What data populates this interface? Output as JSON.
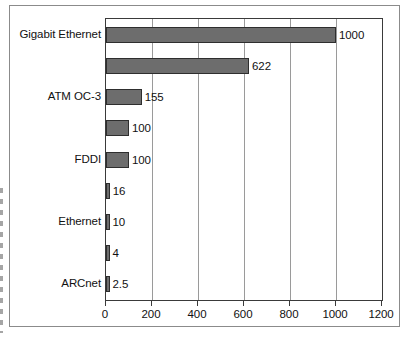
{
  "chart_data": {
    "type": "bar",
    "orientation": "horizontal",
    "title": "",
    "subtitle": "",
    "xlabel": "",
    "ylabel": "",
    "xlim": [
      0,
      1200
    ],
    "xticks": [
      0,
      200,
      400,
      600,
      800,
      1000,
      1200
    ],
    "xtick_labels": [
      "0",
      "200",
      "400",
      "600",
      "800",
      "1000",
      "1200"
    ],
    "grid": true,
    "grid_axis": "x",
    "legend": false,
    "bar_fill_color": "#6d6d6d",
    "bar_edge_color": "#2e2e2e",
    "axis_color": "#3a3a3a",
    "grid_color": "#9a9a9a",
    "categories": [
      "Gigabit Ethernet",
      "",
      "ATM OC-3",
      "",
      "FDDI",
      "",
      "Ethernet",
      "",
      "ARCnet"
    ],
    "values": [
      1000,
      622,
      155,
      100,
      100,
      16,
      10,
      4,
      2.5
    ],
    "data_labels": [
      "1000",
      "622",
      "155",
      "100",
      "100",
      "16",
      "10",
      "4",
      "2.5"
    ],
    "visible_category_labels": [
      "Gigabit Ethernet",
      "ATM OC-3",
      "FDDI",
      "Ethernet",
      "ARCnet"
    ],
    "bars": [
      {
        "category": "Gigabit Ethernet",
        "value": 1000,
        "label": "1000",
        "show_category": true
      },
      {
        "category": "",
        "value": 622,
        "label": "622",
        "show_category": false
      },
      {
        "category": "ATM OC-3",
        "value": 155,
        "label": "155",
        "show_category": true
      },
      {
        "category": "",
        "value": 100,
        "label": "100",
        "show_category": false
      },
      {
        "category": "FDDI",
        "value": 100,
        "label": "100",
        "show_category": true
      },
      {
        "category": "",
        "value": 16,
        "label": "16",
        "show_category": false
      },
      {
        "category": "Ethernet",
        "value": 10,
        "label": "10",
        "show_category": true
      },
      {
        "category": "",
        "value": 4,
        "label": "4",
        "show_category": false
      },
      {
        "category": "ARCnet",
        "value": 2.5,
        "label": "2.5",
        "show_category": true
      }
    ]
  }
}
